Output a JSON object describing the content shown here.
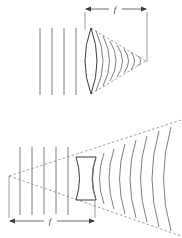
{
  "figure": {
    "background_color": "#ffffff",
    "line_color": "#6f6f6f",
    "lens_color": "#3a3a3a",
    "dashed_color": "#8a8a8a",
    "dimension_color": "#4a4a4a"
  },
  "panels": [
    {
      "id": "converging-lens-panel",
      "name": "top-diagram",
      "lens_type": "biconvex converging lens",
      "focal_label": "f",
      "description": "Plane wavefronts from the left converge after the convex lens to a focal point on the right",
      "dimension": {
        "label": "f",
        "from": "lens-center",
        "to": "focal-point",
        "y": 9,
        "x_start": 85,
        "x_end": 147,
        "label_x": 115,
        "label_y": 7
      },
      "plane_wavefronts": {
        "count": 4,
        "x_positions": [
          40,
          52,
          64,
          76
        ],
        "y_top": 28,
        "y_bottom": 95
      },
      "lens": {
        "type": "convex",
        "x_left": 79,
        "x_right": 103,
        "y_top": 28,
        "y_bottom": 94,
        "bulge": 12
      },
      "converging_wavefronts": {
        "count": 7,
        "focal_point_x": 146,
        "focal_point_y": 61
      },
      "focal_point": {
        "x": 146,
        "y": 61
      }
    },
    {
      "id": "diverging-lens-panel",
      "name": "bottom-diagram",
      "lens_type": "biconcave diverging lens",
      "focal_label": "f",
      "description": "Plane wavefronts from the left diverge after the concave lens, appearing to come from a virtual focus on the left",
      "dimension": {
        "label": "f",
        "from": "virtual-focus",
        "to": "lens-center",
        "y": 221,
        "x_start": 9,
        "x_end": 95,
        "label_x": 50,
        "label_y": 219
      },
      "plane_wavefronts": {
        "count": 6,
        "x_positions": [
          20,
          32,
          44,
          56,
          68,
          76
        ],
        "y_top": 147,
        "y_bottom": 215
      },
      "lens": {
        "type": "concave",
        "x_left": 76,
        "x_right": 96,
        "y_top": 157,
        "y_bottom": 200,
        "waist": 7
      },
      "diverging_wavefronts": {
        "count": 8
      },
      "virtual_focus": {
        "x": 9,
        "y": 176
      }
    }
  ]
}
